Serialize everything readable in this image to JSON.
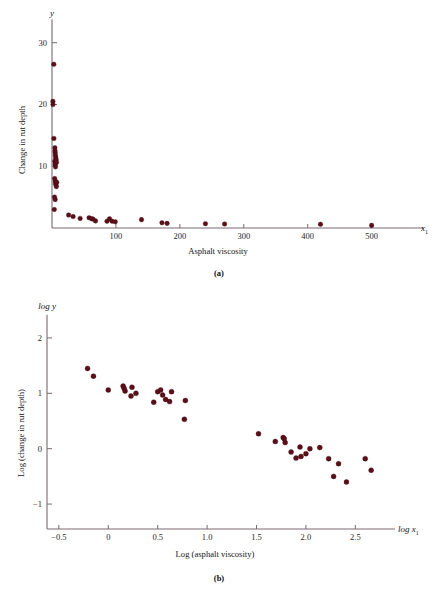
{
  "figure": {
    "background": "#ffffff",
    "point_color": "#5b0f18",
    "axis_color": "#7a6a72"
  },
  "panel_a": {
    "caption": "(a)",
    "y_axis_symbol": "y",
    "x_axis_symbol": "x",
    "x_axis_symbol_sub": "1",
    "y_axis_title": "Change in rut depth",
    "x_axis_title": "Asphalt viscosity"
  },
  "panel_b": {
    "caption": "(b)",
    "y_axis_symbol": "log y",
    "x_axis_symbol": "log x",
    "x_axis_symbol_sub": "1",
    "y_axis_title": "Log (change in rut depth)",
    "x_axis_title": "Log (asphalt viscosity)"
  },
  "chart_data": [
    {
      "type": "scatter",
      "id": "panel-a",
      "title": "(a)",
      "xlabel": "Asphalt viscosity",
      "ylabel": "Change in rut depth",
      "x_axis_symbol": "x1",
      "y_axis_symbol": "y",
      "xlim": [
        0,
        560
      ],
      "ylim": [
        0,
        34
      ],
      "xticks": [
        100,
        200,
        300,
        400,
        500
      ],
      "xticklabels": [
        "100",
        "200",
        "300",
        "400",
        "500"
      ],
      "yticks": [
        10,
        20,
        30
      ],
      "yticklabels": [
        "10",
        "20",
        "30"
      ],
      "grid": false,
      "legend": false,
      "points": [
        [
          2.8,
          26.5
        ],
        [
          1.4,
          20.5
        ],
        [
          1.5,
          20.0
        ],
        [
          3.0,
          14.5
        ],
        [
          4.5,
          13.0
        ],
        [
          4.7,
          12.5
        ],
        [
          5.0,
          12.2
        ],
        [
          5.2,
          11.8
        ],
        [
          5.8,
          11.5
        ],
        [
          6.0,
          11.2
        ],
        [
          4.4,
          10.8
        ],
        [
          4.9,
          10.3
        ],
        [
          5.5,
          9.9
        ],
        [
          6.5,
          11.0
        ],
        [
          7.0,
          10.6
        ],
        [
          4.2,
          8.0
        ],
        [
          5.0,
          7.6
        ],
        [
          5.6,
          7.2
        ],
        [
          6.2,
          7.0
        ],
        [
          6.8,
          6.7
        ],
        [
          7.4,
          7.4
        ],
        [
          4.0,
          5.0
        ],
        [
          5.0,
          4.6
        ],
        [
          3.6,
          3.0
        ],
        [
          26,
          2.1
        ],
        [
          33,
          1.85
        ],
        [
          44,
          1.55
        ],
        [
          58,
          1.65
        ],
        [
          62,
          1.5
        ],
        [
          64,
          1.45
        ],
        [
          68,
          1.15
        ],
        [
          86,
          1.1
        ],
        [
          90,
          1.5
        ],
        [
          94,
          1.1
        ],
        [
          99,
          1.0
        ],
        [
          140,
          1.35
        ],
        [
          172,
          0.85
        ],
        [
          180,
          0.75
        ],
        [
          240,
          0.7
        ],
        [
          270,
          0.65
        ],
        [
          420,
          0.6
        ],
        [
          500,
          0.42
        ]
      ]
    },
    {
      "type": "scatter",
      "id": "panel-b",
      "title": "(b)",
      "xlabel": "Log (asphalt viscosity)",
      "ylabel": "Log (change in rut depth)",
      "x_axis_symbol": "log x1",
      "y_axis_symbol": "log y",
      "xlim": [
        -0.62,
        2.8
      ],
      "ylim": [
        -1.45,
        2.45
      ],
      "xticks": [
        -0.5,
        0,
        0.5,
        1.0,
        1.5,
        2.0,
        2.5
      ],
      "xticklabels": [
        "−0.5",
        "0",
        "0.5",
        "1.0",
        "1.5",
        "2.0",
        "2.5"
      ],
      "yticks": [
        -1,
        0,
        1,
        2
      ],
      "yticklabels": [
        "−1",
        "0",
        "1",
        "2"
      ],
      "grid": false,
      "legend": false,
      "points": [
        [
          -0.21,
          1.45
        ],
        [
          -0.15,
          1.31
        ],
        [
          0.0,
          1.06
        ],
        [
          0.15,
          1.13
        ],
        [
          0.16,
          1.09
        ],
        [
          0.17,
          1.04
        ],
        [
          0.24,
          1.11
        ],
        [
          0.23,
          0.95
        ],
        [
          0.28,
          1.0
        ],
        [
          0.46,
          0.84
        ],
        [
          0.5,
          1.03
        ],
        [
          0.53,
          1.06
        ],
        [
          0.55,
          0.97
        ],
        [
          0.58,
          0.89
        ],
        [
          0.62,
          0.85
        ],
        [
          0.64,
          1.03
        ],
        [
          0.78,
          0.87
        ],
        [
          0.77,
          0.53
        ],
        [
          1.52,
          0.27
        ],
        [
          1.69,
          0.13
        ],
        [
          1.77,
          0.2
        ],
        [
          1.78,
          0.18
        ],
        [
          1.79,
          0.11
        ],
        [
          1.85,
          -0.06
        ],
        [
          1.9,
          -0.17
        ],
        [
          1.94,
          0.03
        ],
        [
          1.95,
          -0.14
        ],
        [
          2.0,
          -0.09
        ],
        [
          2.04,
          0.0
        ],
        [
          2.14,
          0.02
        ],
        [
          2.23,
          -0.18
        ],
        [
          2.28,
          -0.5
        ],
        [
          2.33,
          -0.27
        ],
        [
          2.41,
          -0.6
        ],
        [
          2.6,
          -0.18
        ],
        [
          2.66,
          -0.39
        ]
      ]
    }
  ]
}
